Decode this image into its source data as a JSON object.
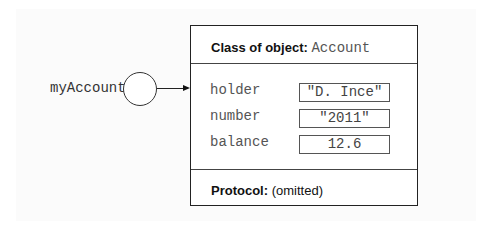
{
  "reference": {
    "variable_name": "myAccount"
  },
  "object": {
    "class_label": "Class of object:",
    "class_name": "Account",
    "fields": [
      {
        "name": "holder",
        "value": "\"D. Ince\""
      },
      {
        "name": "number",
        "value": "\"2011\""
      },
      {
        "name": "balance",
        "value": "12.6"
      }
    ],
    "protocol_label": "Protocol:",
    "protocol_value": "(omitted)"
  }
}
